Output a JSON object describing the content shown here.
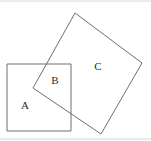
{
  "figure": {
    "width": 151,
    "height": 141,
    "background_color": "#ffffff",
    "stroke_color": "#6e6e6e",
    "stroke_width": 1,
    "label_color": "#2b2b2b",
    "edge_rule_color": "#d8d8d8"
  },
  "shapes": [
    {
      "id": "square-a",
      "name": "upright-square",
      "description": "Axis-aligned square on the lower left",
      "points": "7,64 71,64 71,131 7,131",
      "rotation_deg": 0
    },
    {
      "id": "square-c",
      "name": "rotated-square",
      "description": "Tilted square on the upper right",
      "points": "75,13 142,63 101,134 33,88",
      "rotation_deg": 37
    }
  ],
  "labels": [
    {
      "id": "label-a",
      "text": "A",
      "x": 25,
      "y": 106,
      "region": "upright square only"
    },
    {
      "id": "label-b",
      "text": "B",
      "x": 55,
      "y": 81,
      "region": "overlap of both squares"
    },
    {
      "id": "label-c",
      "text": "C",
      "x": 98,
      "y": 67,
      "region": "rotated square only"
    }
  ],
  "edge_rules": [
    {
      "id": "top-rule",
      "x1": 0,
      "y1": 1,
      "x2": 151,
      "y2": 1
    },
    {
      "id": "bottom-rule",
      "x1": 0,
      "y1": 139,
      "x2": 151,
      "y2": 139
    }
  ]
}
